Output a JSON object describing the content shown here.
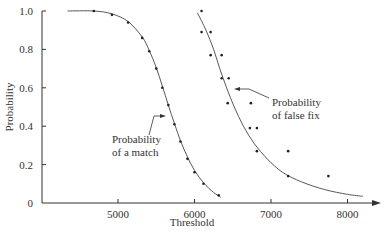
{
  "chart_data": {
    "type": "line",
    "title": "",
    "xlabel": "Threshold",
    "ylabel": "Probability",
    "xlim": [
      4250,
      8450
    ],
    "ylim": [
      0,
      1.0
    ],
    "x_ticks": [
      5000,
      6000,
      7000,
      8000
    ],
    "y_ticks": [
      0,
      0.2,
      0.4,
      0.6,
      0.8,
      1.0
    ],
    "y_tick_labels": [
      "0",
      "0.2",
      "0.4",
      "0.6",
      "0.8",
      "1.0"
    ],
    "grid": false,
    "legend": "none (inline annotations)",
    "series": [
      {
        "name": "Probability of a match",
        "style": "fitted curve with data points",
        "points": [
          [
            4684,
            1.0
          ],
          [
            4921,
            0.98
          ],
          [
            5132,
            0.94
          ],
          [
            5316,
            0.86
          ],
          [
            5408,
            0.79
          ],
          [
            5500,
            0.7
          ],
          [
            5579,
            0.6
          ],
          [
            5658,
            0.51
          ],
          [
            5737,
            0.41
          ],
          [
            5816,
            0.32
          ],
          [
            5908,
            0.23
          ],
          [
            6000,
            0.16
          ],
          [
            6118,
            0.1
          ],
          [
            6316,
            0.04
          ]
        ],
        "curve": [
          [
            4342,
            1.0
          ],
          [
            4684,
            1.0
          ],
          [
            4921,
            0.985
          ],
          [
            5132,
            0.945
          ],
          [
            5316,
            0.865
          ],
          [
            5408,
            0.795
          ],
          [
            5500,
            0.705
          ],
          [
            5579,
            0.61
          ],
          [
            5658,
            0.51
          ],
          [
            5737,
            0.415
          ],
          [
            5816,
            0.325
          ],
          [
            5908,
            0.24
          ],
          [
            6000,
            0.17
          ],
          [
            6118,
            0.105
          ],
          [
            6250,
            0.055
          ],
          [
            6342,
            0.03
          ]
        ]
      },
      {
        "name": "Probability of false fix",
        "style": "fitted curve with data points",
        "points": [
          [
            6092,
            1.0
          ],
          [
            6092,
            0.89
          ],
          [
            6211,
            0.89
          ],
          [
            6211,
            0.77
          ],
          [
            6355,
            0.77
          ],
          [
            6355,
            0.65
          ],
          [
            6447,
            0.65
          ],
          [
            6434,
            0.52
          ],
          [
            6737,
            0.52
          ],
          [
            6724,
            0.39
          ],
          [
            6816,
            0.39
          ],
          [
            6816,
            0.27
          ],
          [
            7224,
            0.27
          ],
          [
            7224,
            0.14
          ],
          [
            7750,
            0.14
          ]
        ],
        "curve": [
          [
            6039,
            0.99
          ],
          [
            6150,
            0.9
          ],
          [
            6250,
            0.8
          ],
          [
            6330,
            0.7
          ],
          [
            6420,
            0.6
          ],
          [
            6520,
            0.5
          ],
          [
            6640,
            0.4
          ],
          [
            6780,
            0.31
          ],
          [
            6950,
            0.23
          ],
          [
            7150,
            0.16
          ],
          [
            7400,
            0.11
          ],
          [
            7700,
            0.07
          ],
          [
            8000,
            0.045
          ],
          [
            8200,
            0.035
          ]
        ]
      }
    ],
    "annotations": [
      {
        "text_lines": [
          "Probability",
          "of a match"
        ],
        "points_to": "Probability of a match"
      },
      {
        "text_lines": [
          "Probability",
          "of false fix"
        ],
        "points_to": "Probability of false fix"
      }
    ]
  },
  "labels": {
    "xlabel": "Threshold",
    "ylabel": "Probability",
    "match_line1": "Probability",
    "match_line2": "of a match",
    "false_line1": "Probability",
    "false_line2": "of false fix"
  }
}
